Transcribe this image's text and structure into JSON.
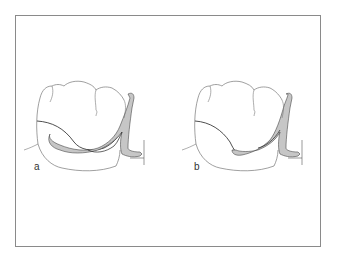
{
  "figure": {
    "panels": [
      {
        "id": "a",
        "label": "a",
        "description": "Tooth with circumferential clasp arm positioned low, deep in the undercut"
      },
      {
        "id": "b",
        "label": "b",
        "description": "Tooth with shorter clasp arm terminating near the survey line"
      }
    ],
    "colors": {
      "frame": "#8a8a8a",
      "outline": "#2a2a2a",
      "tooth_outline": "#6a6a6a",
      "clasp_fill": "#c6c6c6",
      "background": "#ffffff"
    }
  }
}
